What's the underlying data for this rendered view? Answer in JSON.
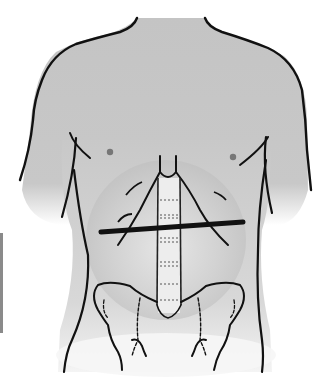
{
  "figure": {
    "caption": "Transverse line across upper abdomen",
    "colors": {
      "skin_fill": "#c4c4c4",
      "outline": "#111111",
      "background": "#ffffff",
      "highlight": "#e6e6e6",
      "marker_line": "#111111"
    },
    "elements": {
      "torso": "torso-outline",
      "nipples": [
        "left-nipple",
        "right-nipple"
      ],
      "spine": "lumbar-spine",
      "pelvis": "pelvis",
      "rib_cage": "costal-margin",
      "marker": "transverse-line"
    }
  }
}
